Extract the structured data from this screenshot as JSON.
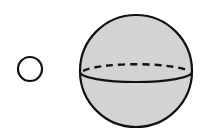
{
  "diagram": {
    "small_circle": {
      "cx": 30,
      "cy": 69,
      "r": 12,
      "stroke": "#111111",
      "fill": "#ffffff"
    },
    "sphere": {
      "cx": 136,
      "cy": 71,
      "r": 56,
      "fill": "#d3d3d3",
      "stroke": "#111111",
      "equator": {
        "front": "solid",
        "back": "dashed",
        "ry": 10
      }
    }
  }
}
